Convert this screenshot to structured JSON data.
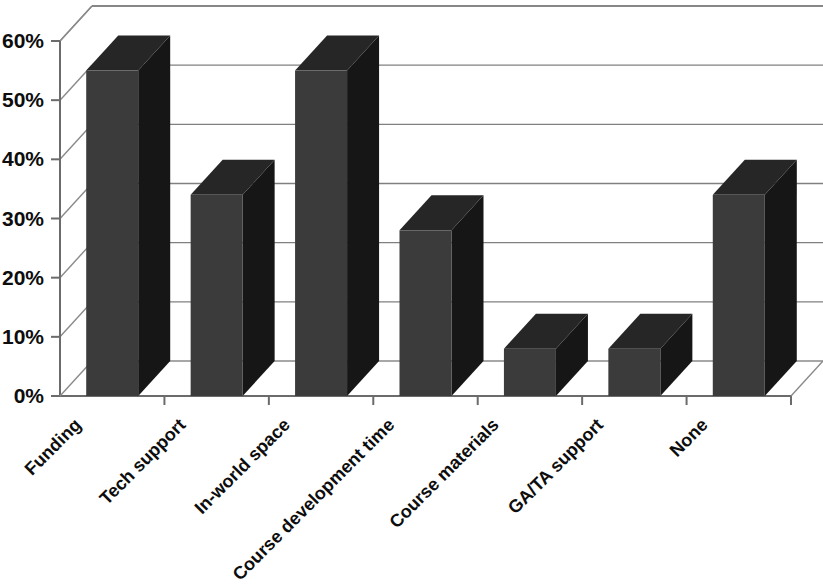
{
  "chart_data": {
    "type": "bar",
    "title": "",
    "subtitle": "",
    "xlabel": "",
    "ylabel": "",
    "categories": [
      "Funding",
      "Tech support",
      "In-world space",
      "Course development time",
      "Course materials",
      "GA/TA support",
      "None"
    ],
    "values": [
      55,
      34,
      55,
      28,
      8,
      8,
      34
    ],
    "value_labels": [
      "55%",
      "34%",
      "55%",
      "28%",
      "8%",
      "8%",
      "34%"
    ],
    "ylim": [
      0,
      60
    ],
    "ytick_values": [
      0,
      10,
      20,
      30,
      40,
      50,
      60
    ],
    "ytick_labels": [
      "0%",
      "10%",
      "20%",
      "30%",
      "40%",
      "50%",
      "60%"
    ],
    "grid": true,
    "legend": false,
    "legend_position": "none",
    "style": "3d-column",
    "bar_color": "#3b3b3b",
    "bar_side_color": "#161616",
    "bar_top_color": "#262626",
    "grid_color": "#808080",
    "axis_color": "#6b6b6b",
    "background_color": "#ffffff",
    "label_rotation_degrees": -45,
    "annotations": []
  },
  "chart": {
    "y_axis_name": "y-axis",
    "x_axis_name": "x-axis",
    "plot_area_name": "plot-area"
  }
}
